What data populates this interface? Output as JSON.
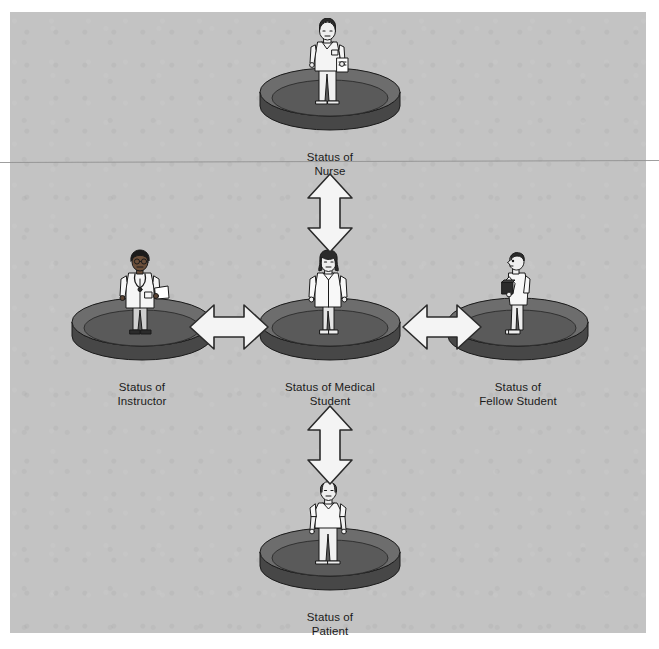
{
  "diagram": {
    "background_color": "#c3c3c3",
    "page_color": "#ffffff",
    "arrow_fill": "#f4f4f4",
    "arrow_stroke": "#2b2b2b",
    "pedestal_top_color": "#6d6d6d",
    "pedestal_side_color": "#474747",
    "figure_fill": "#efefef",
    "ink_color": "#1b1b1b",
    "nodes": [
      {
        "id": "nurse",
        "label": "Status of\nNurse",
        "label_line1": "Status of",
        "label_line2": "Nurse",
        "person": "nurse-figure",
        "description": "Nurse in white uniform holding a clipboard, standing on a disc pedestal"
      },
      {
        "id": "instructor",
        "label": "Status of\nInstructor",
        "label_line1": "Status of",
        "label_line2": "Instructor",
        "person": "instructor-figure",
        "description": "Instructor in white lab coat with glasses, stethoscope and papers, standing on a disc pedestal"
      },
      {
        "id": "medical-student",
        "label": "Status of Medical\nStudent",
        "label_line1": "Status of Medical",
        "label_line2": "Student",
        "person": "medical-student-figure",
        "description": "Medical student in a white coat standing on a disc pedestal at the center"
      },
      {
        "id": "fellow-student",
        "label": "Status of\nFellow Student",
        "label_line1": "Status of",
        "label_line2": "Fellow Student",
        "person": "fellow-student-figure",
        "description": "Fellow student in profile holding a dark book, standing on a disc pedestal"
      },
      {
        "id": "patient",
        "label": "Status of\nPatient",
        "label_line1": "Status of",
        "label_line2": "Patient",
        "person": "patient-figure",
        "description": "Balding patient in a light hospital gown standing on a disc pedestal"
      }
    ],
    "connectors": [
      {
        "id": "nurse-student",
        "from": "nurse",
        "to": "medical-student",
        "orientation": "vertical",
        "style": "double-headed"
      },
      {
        "id": "instructor-student",
        "from": "instructor",
        "to": "medical-student",
        "orientation": "horizontal",
        "style": "double-headed"
      },
      {
        "id": "student-fellow",
        "from": "medical-student",
        "to": "fellow-student",
        "orientation": "horizontal",
        "style": "double-headed"
      },
      {
        "id": "student-patient",
        "from": "medical-student",
        "to": "patient",
        "orientation": "vertical",
        "style": "double-headed"
      }
    ]
  }
}
